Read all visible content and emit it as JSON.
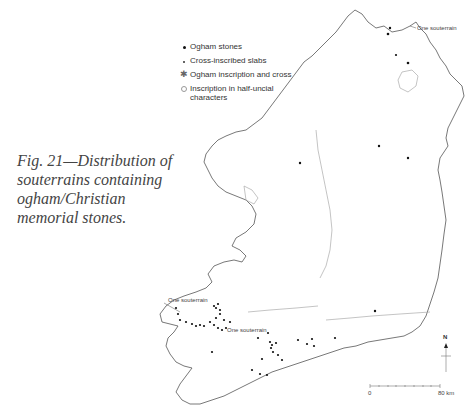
{
  "figure": {
    "caption": "Fig. 21—Distribution of souterrains containing ogham/Christian memorial stones."
  },
  "legend": {
    "items": [
      {
        "symbol": "filled-dot",
        "label": "Ogham stones"
      },
      {
        "symbol": "small-dot",
        "label": "Cross-inscribed slabs"
      },
      {
        "symbol": "asterisk",
        "label": "Ogham inscription and cross"
      },
      {
        "symbol": "open-circle",
        "label": "Inscription in  half-uncial characters"
      }
    ]
  },
  "annotations": {
    "northeast": "One souterrain",
    "southwest_upper": "One souterrain",
    "southwest_lower": "One souterrain"
  },
  "scale_bar": {
    "start_label": "0",
    "end_label": "80 km"
  },
  "north_arrow": {
    "label": "N"
  },
  "colors": {
    "coastline": "#555555",
    "inland": "#aaaaaa",
    "dots": "#111111"
  }
}
